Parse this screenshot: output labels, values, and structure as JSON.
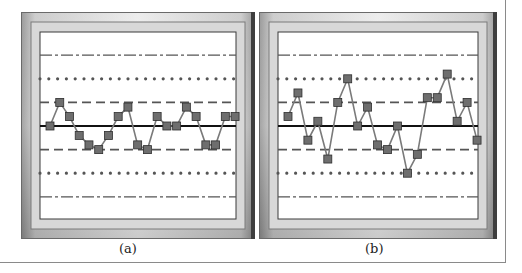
{
  "figure": {
    "panels": [
      {
        "label": "(a)"
      },
      {
        "label": "(b)"
      }
    ]
  },
  "chart_data": [
    {
      "type": "line",
      "title": "(a)",
      "xlabel": "",
      "ylabel": "",
      "units": "standard deviations from center line",
      "ylim": [
        -3.5,
        3.5
      ],
      "reference_lines": [
        {
          "value": 3,
          "style": "dash-dot"
        },
        {
          "value": 2,
          "style": "dotted"
        },
        {
          "value": 1,
          "style": "dashed"
        },
        {
          "value": 0,
          "style": "solid"
        },
        {
          "value": -1,
          "style": "dashed"
        },
        {
          "value": -2,
          "style": "dotted"
        },
        {
          "value": -3,
          "style": "dash-dot"
        }
      ],
      "x": [
        1,
        2,
        3,
        4,
        5,
        6,
        7,
        8,
        9,
        10,
        11,
        12,
        13,
        14,
        15,
        16,
        17,
        18,
        19,
        20
      ],
      "series": [
        {
          "name": "samples",
          "marker": "square",
          "values": [
            0,
            1.0,
            0.4,
            -0.4,
            -0.8,
            -1.0,
            -0.4,
            0.4,
            0.8,
            -0.8,
            -1.0,
            0.4,
            0,
            0,
            0.8,
            0.4,
            -0.8,
            -0.8,
            0.4,
            0.4
          ]
        }
      ],
      "grid": false,
      "legend": null
    },
    {
      "type": "line",
      "title": "(b)",
      "xlabel": "",
      "ylabel": "",
      "units": "standard deviations from center line",
      "ylim": [
        -3.5,
        3.5
      ],
      "reference_lines": [
        {
          "value": 3,
          "style": "dash-dot"
        },
        {
          "value": 2,
          "style": "dotted"
        },
        {
          "value": 1,
          "style": "dashed"
        },
        {
          "value": 0,
          "style": "solid"
        },
        {
          "value": -1,
          "style": "dashed"
        },
        {
          "value": -2,
          "style": "dotted"
        },
        {
          "value": -3,
          "style": "dash-dot"
        }
      ],
      "x": [
        1,
        2,
        3,
        4,
        5,
        6,
        7,
        8,
        9,
        10,
        11,
        12,
        13,
        14,
        15,
        16,
        17,
        18,
        19,
        20
      ],
      "series": [
        {
          "name": "samples",
          "marker": "square",
          "values": [
            0.4,
            1.4,
            -0.6,
            0.2,
            -1.4,
            1.0,
            2.0,
            0,
            0.8,
            -0.8,
            -1.0,
            0,
            -2.0,
            -1.2,
            1.2,
            1.2,
            2.2,
            0.2,
            1.0,
            -0.6
          ]
        }
      ],
      "grid": false,
      "legend": null
    }
  ],
  "colors": {
    "frame_light": "#f2f2f2",
    "frame_mid": "#b8b8b8",
    "frame_dark": "#5a5a5a",
    "plot_bg": "#ffffff",
    "ref_line": "#555555",
    "center_line": "#111111",
    "data_line": "#7a7a7a",
    "marker_fill": "#6e6e6e",
    "marker_stroke": "#2e2e2e"
  }
}
